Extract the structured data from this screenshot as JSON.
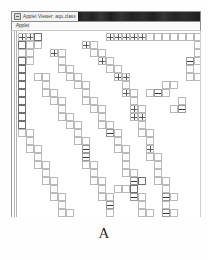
{
  "figure": {
    "caption": "A"
  },
  "window": {
    "title": "Applet Viewer: aqu.class",
    "title_icon": "applet-icon",
    "menu": {
      "applet_label": "Applet"
    }
  },
  "colors": {
    "cell_stroke": "#b9b9b9",
    "cell_stroke_dark": "#6f6f6f",
    "titlebar_bg": "#f2f2f2",
    "titlebar_fill": "#1a1a1a",
    "canvas_bg": "#ffffff",
    "caption_color": "#2b2b2b"
  },
  "chart_data": {
    "type": "heatmap",
    "title": "",
    "xlabel": "",
    "ylabel": "",
    "cell_size": 8,
    "grid_origin": [
      6,
      2
    ],
    "grid_cols": 23,
    "grid_rows": 23,
    "legend": [],
    "cells": [
      {
        "c": 0,
        "r": 0,
        "s": "cross"
      },
      {
        "c": 1,
        "r": 0,
        "s": "cross"
      },
      {
        "c": 2,
        "r": 0,
        "s": "dark"
      },
      {
        "c": 11,
        "r": 0,
        "s": "cross"
      },
      {
        "c": 12,
        "r": 0,
        "s": "cross"
      },
      {
        "c": 13,
        "r": 0,
        "s": "cross"
      },
      {
        "c": 14,
        "r": 0,
        "s": "cross"
      },
      {
        "c": 15,
        "r": 0,
        "s": "cross"
      },
      {
        "c": 16,
        "r": 0,
        "s": "plain"
      },
      {
        "c": 17,
        "r": 0,
        "s": "plain"
      },
      {
        "c": 18,
        "r": 0,
        "s": "plain"
      },
      {
        "c": 19,
        "r": 0,
        "s": "plain"
      },
      {
        "c": 20,
        "r": 0,
        "s": "plain"
      },
      {
        "c": 21,
        "r": 0,
        "s": "plain"
      },
      {
        "c": 22,
        "r": 0,
        "s": "plain"
      },
      {
        "c": 0,
        "r": 1,
        "s": "dark"
      },
      {
        "c": 1,
        "r": 1,
        "s": "plain"
      },
      {
        "c": 2,
        "r": 1,
        "s": "plain"
      },
      {
        "c": 8,
        "r": 1,
        "s": "cross"
      },
      {
        "c": 9,
        "r": 1,
        "s": "plain"
      },
      {
        "c": 22,
        "r": 1,
        "s": "plain"
      },
      {
        "c": 0,
        "r": 2,
        "s": "plain"
      },
      {
        "c": 1,
        "r": 2,
        "s": "plain"
      },
      {
        "c": 4,
        "r": 2,
        "s": "cross"
      },
      {
        "c": 5,
        "r": 2,
        "s": "plain"
      },
      {
        "c": 9,
        "r": 2,
        "s": "plain"
      },
      {
        "c": 10,
        "r": 2,
        "s": "plain"
      },
      {
        "c": 22,
        "r": 2,
        "s": "plain"
      },
      {
        "c": 0,
        "r": 3,
        "s": "dark"
      },
      {
        "c": 1,
        "r": 3,
        "s": "plain"
      },
      {
        "c": 5,
        "r": 3,
        "s": "plain"
      },
      {
        "c": 10,
        "r": 3,
        "s": "cross"
      },
      {
        "c": 11,
        "r": 3,
        "s": "plain"
      },
      {
        "c": 21,
        "r": 3,
        "s": "bar"
      },
      {
        "c": 22,
        "r": 3,
        "s": "plain"
      },
      {
        "c": 0,
        "r": 4,
        "s": "dark"
      },
      {
        "c": 5,
        "r": 4,
        "s": "plain"
      },
      {
        "c": 6,
        "r": 4,
        "s": "plain"
      },
      {
        "c": 11,
        "r": 4,
        "s": "plain"
      },
      {
        "c": 12,
        "r": 4,
        "s": "plain"
      },
      {
        "c": 21,
        "r": 4,
        "s": "plain"
      },
      {
        "c": 0,
        "r": 5,
        "s": "dark"
      },
      {
        "c": 2,
        "r": 5,
        "s": "plain"
      },
      {
        "c": 3,
        "r": 5,
        "s": "plain"
      },
      {
        "c": 6,
        "r": 5,
        "s": "plain"
      },
      {
        "c": 7,
        "r": 5,
        "s": "plain"
      },
      {
        "c": 12,
        "r": 5,
        "s": "cross"
      },
      {
        "c": 13,
        "r": 5,
        "s": "cross"
      },
      {
        "c": 21,
        "r": 5,
        "s": "plain"
      },
      {
        "c": 22,
        "r": 5,
        "s": "plain"
      },
      {
        "c": 0,
        "r": 6,
        "s": "dark"
      },
      {
        "c": 3,
        "r": 6,
        "s": "plain"
      },
      {
        "c": 7,
        "r": 6,
        "s": "plain"
      },
      {
        "c": 8,
        "r": 6,
        "s": "plain"
      },
      {
        "c": 13,
        "r": 6,
        "s": "plain"
      },
      {
        "c": 18,
        "r": 6,
        "s": "plain"
      },
      {
        "c": 19,
        "r": 6,
        "s": "plain"
      },
      {
        "c": 0,
        "r": 7,
        "s": "dark"
      },
      {
        "c": 3,
        "r": 7,
        "s": "plain"
      },
      {
        "c": 4,
        "r": 7,
        "s": "plain"
      },
      {
        "c": 8,
        "r": 7,
        "s": "plain"
      },
      {
        "c": 13,
        "r": 7,
        "s": "cross"
      },
      {
        "c": 14,
        "r": 7,
        "s": "plain"
      },
      {
        "c": 16,
        "r": 7,
        "s": "plain"
      },
      {
        "c": 17,
        "r": 7,
        "s": "bar"
      },
      {
        "c": 18,
        "r": 7,
        "s": "plain"
      },
      {
        "c": 0,
        "r": 8,
        "s": "dark"
      },
      {
        "c": 4,
        "r": 8,
        "s": "plain"
      },
      {
        "c": 5,
        "r": 8,
        "s": "plain"
      },
      {
        "c": 8,
        "r": 8,
        "s": "plain"
      },
      {
        "c": 9,
        "r": 8,
        "s": "plain"
      },
      {
        "c": 14,
        "r": 8,
        "s": "plain"
      },
      {
        "c": 20,
        "r": 8,
        "s": "plain"
      },
      {
        "c": 0,
        "r": 9,
        "s": "dark"
      },
      {
        "c": 5,
        "r": 9,
        "s": "plain"
      },
      {
        "c": 9,
        "r": 9,
        "s": "plain"
      },
      {
        "c": 10,
        "r": 9,
        "s": "plain"
      },
      {
        "c": 14,
        "r": 9,
        "s": "cross"
      },
      {
        "c": 15,
        "r": 9,
        "s": "plain"
      },
      {
        "c": 19,
        "r": 9,
        "s": "plain"
      },
      {
        "c": 20,
        "r": 9,
        "s": "bar"
      },
      {
        "c": 0,
        "r": 10,
        "s": "dark"
      },
      {
        "c": 5,
        "r": 10,
        "s": "plain"
      },
      {
        "c": 6,
        "r": 10,
        "s": "plain"
      },
      {
        "c": 10,
        "r": 10,
        "s": "plain"
      },
      {
        "c": 14,
        "r": 10,
        "s": "cross"
      },
      {
        "c": 15,
        "r": 10,
        "s": "cross"
      },
      {
        "c": 0,
        "r": 11,
        "s": "dark"
      },
      {
        "c": 6,
        "r": 11,
        "s": "plain"
      },
      {
        "c": 7,
        "r": 11,
        "s": "plain"
      },
      {
        "c": 10,
        "r": 11,
        "s": "plain"
      },
      {
        "c": 11,
        "r": 11,
        "s": "plain"
      },
      {
        "c": 15,
        "r": 11,
        "s": "plain"
      },
      {
        "c": 0,
        "r": 12,
        "s": "plain"
      },
      {
        "c": 1,
        "r": 12,
        "s": "plain"
      },
      {
        "c": 7,
        "r": 12,
        "s": "plain"
      },
      {
        "c": 11,
        "r": 12,
        "s": "bar"
      },
      {
        "c": 12,
        "r": 12,
        "s": "plain"
      },
      {
        "c": 15,
        "r": 12,
        "s": "plain"
      },
      {
        "c": 16,
        "r": 12,
        "s": "plain"
      },
      {
        "c": 1,
        "r": 13,
        "s": "plain"
      },
      {
        "c": 7,
        "r": 13,
        "s": "plain"
      },
      {
        "c": 8,
        "r": 13,
        "s": "plain"
      },
      {
        "c": 12,
        "r": 13,
        "s": "plain"
      },
      {
        "c": 16,
        "r": 13,
        "s": "plain"
      },
      {
        "c": 1,
        "r": 14,
        "s": "plain"
      },
      {
        "c": 2,
        "r": 14,
        "s": "plain"
      },
      {
        "c": 8,
        "r": 14,
        "s": "bar"
      },
      {
        "c": 12,
        "r": 14,
        "s": "plain"
      },
      {
        "c": 13,
        "r": 14,
        "s": "plain"
      },
      {
        "c": 16,
        "r": 14,
        "s": "cross"
      },
      {
        "c": 2,
        "r": 15,
        "s": "plain"
      },
      {
        "c": 8,
        "r": 15,
        "s": "bar"
      },
      {
        "c": 13,
        "r": 15,
        "s": "plain"
      },
      {
        "c": 16,
        "r": 15,
        "s": "plain"
      },
      {
        "c": 17,
        "r": 15,
        "s": "plain"
      },
      {
        "c": 2,
        "r": 16,
        "s": "plain"
      },
      {
        "c": 3,
        "r": 16,
        "s": "plain"
      },
      {
        "c": 8,
        "r": 16,
        "s": "plain"
      },
      {
        "c": 9,
        "r": 16,
        "s": "plain"
      },
      {
        "c": 13,
        "r": 16,
        "s": "plain"
      },
      {
        "c": 17,
        "r": 16,
        "s": "plain"
      },
      {
        "c": 3,
        "r": 17,
        "s": "plain"
      },
      {
        "c": 9,
        "r": 17,
        "s": "plain"
      },
      {
        "c": 13,
        "r": 17,
        "s": "plain"
      },
      {
        "c": 14,
        "r": 17,
        "s": "plain"
      },
      {
        "c": 17,
        "r": 17,
        "s": "plain"
      },
      {
        "c": 3,
        "r": 18,
        "s": "plain"
      },
      {
        "c": 4,
        "r": 18,
        "s": "plain"
      },
      {
        "c": 9,
        "r": 18,
        "s": "plain"
      },
      {
        "c": 10,
        "r": 18,
        "s": "plain"
      },
      {
        "c": 14,
        "r": 18,
        "s": "bar"
      },
      {
        "c": 15,
        "r": 18,
        "s": "dark"
      },
      {
        "c": 17,
        "r": 18,
        "s": "plain"
      },
      {
        "c": 18,
        "r": 18,
        "s": "plain"
      },
      {
        "c": 4,
        "r": 19,
        "s": "plain"
      },
      {
        "c": 10,
        "r": 19,
        "s": "plain"
      },
      {
        "c": 12,
        "r": 19,
        "s": "plain"
      },
      {
        "c": 13,
        "r": 19,
        "s": "plain"
      },
      {
        "c": 14,
        "r": 19,
        "s": "dark"
      },
      {
        "c": 18,
        "r": 19,
        "s": "plain"
      },
      {
        "c": 4,
        "r": 20,
        "s": "plain"
      },
      {
        "c": 5,
        "r": 20,
        "s": "plain"
      },
      {
        "c": 10,
        "r": 20,
        "s": "plain"
      },
      {
        "c": 11,
        "r": 20,
        "s": "plain"
      },
      {
        "c": 14,
        "r": 20,
        "s": "bar"
      },
      {
        "c": 15,
        "r": 20,
        "s": "plain"
      },
      {
        "c": 18,
        "r": 20,
        "s": "bar"
      },
      {
        "c": 19,
        "r": 20,
        "s": "plain"
      },
      {
        "c": 5,
        "r": 21,
        "s": "plain"
      },
      {
        "c": 11,
        "r": 21,
        "s": "bar"
      },
      {
        "c": 15,
        "r": 21,
        "s": "plain"
      },
      {
        "c": 18,
        "r": 21,
        "s": "plain"
      },
      {
        "c": 5,
        "r": 22,
        "s": "plain"
      },
      {
        "c": 6,
        "r": 22,
        "s": "plain"
      },
      {
        "c": 11,
        "r": 22,
        "s": "plain"
      },
      {
        "c": 15,
        "r": 22,
        "s": "plain"
      },
      {
        "c": 16,
        "r": 22,
        "s": "plain"
      },
      {
        "c": 18,
        "r": 22,
        "s": "bar"
      },
      {
        "c": 19,
        "r": 22,
        "s": "plain"
      }
    ]
  }
}
